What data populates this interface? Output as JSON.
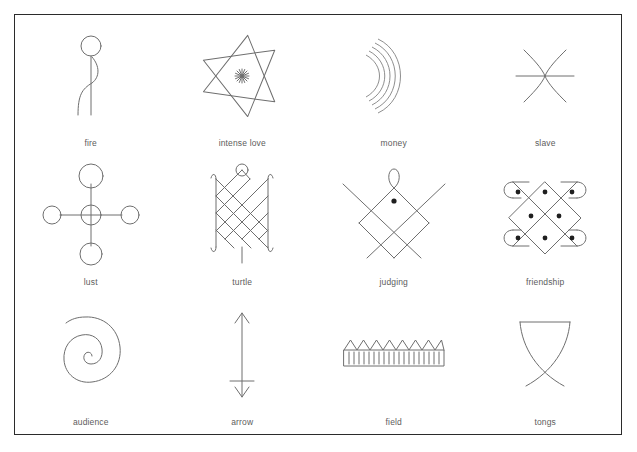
{
  "figure": {
    "background_color": "#ffffff",
    "border_color": "#2b2b2b",
    "stroke_color": "#6e6e6e",
    "label_color": "#5d5d5d",
    "columns": 4,
    "rows": 3
  },
  "symbols": [
    {
      "id": "fire",
      "label": "fire",
      "icon": "stick-figure-flame-icon",
      "row": 1,
      "col": 1
    },
    {
      "id": "intense_love",
      "label": "intense love",
      "icon": "six-pointed-star-asterisk-icon",
      "row": 1,
      "col": 2
    },
    {
      "id": "money",
      "label": "money",
      "icon": "nested-arcs-icon",
      "row": 1,
      "col": 3
    },
    {
      "id": "slave",
      "label": "slave",
      "icon": "hourglass-curves-crossbar-icon",
      "row": 1,
      "col": 4
    },
    {
      "id": "lust",
      "label": "lust",
      "icon": "cross-of-circles-icon",
      "row": 2,
      "col": 1
    },
    {
      "id": "turtle",
      "label": "turtle",
      "icon": "lattice-shell-icon",
      "row": 2,
      "col": 2
    },
    {
      "id": "judging",
      "label": "judging",
      "icon": "crossed-lines-diamond-dot-icon",
      "row": 2,
      "col": 3
    },
    {
      "id": "friendship",
      "label": "friendship",
      "icon": "interlaced-loops-dots-icon",
      "row": 2,
      "col": 4
    },
    {
      "id": "audience",
      "label": "audience",
      "icon": "spiral-icon",
      "row": 3,
      "col": 1
    },
    {
      "id": "arrow",
      "label": "arrow",
      "icon": "double-headed-arrow-icon",
      "row": 3,
      "col": 2
    },
    {
      "id": "field",
      "label": "field",
      "icon": "hatched-rectangle-sawtooth-icon",
      "row": 3,
      "col": 3
    },
    {
      "id": "tongs",
      "label": "tongs",
      "icon": "crossed-curves-goblet-icon",
      "row": 3,
      "col": 4
    }
  ]
}
